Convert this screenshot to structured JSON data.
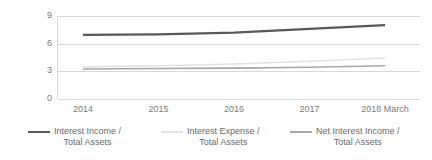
{
  "chart_data": {
    "type": "line",
    "title": "",
    "subtitle": "",
    "xlabel": "",
    "ylabel": "",
    "categories": [
      "2014",
      "2015",
      "2016",
      "2017",
      "2018 March"
    ],
    "ylim": [
      0,
      9
    ],
    "yticks": [
      0,
      3,
      6,
      9
    ],
    "ytick_labels": [
      "0",
      "3",
      "6",
      "9"
    ],
    "grid": "horizontal",
    "legend_position": "bottom",
    "series": [
      {
        "name": "Interest Income /\nTotal Assets",
        "name_line1": "Interest Income /",
        "name_line2": "Total Assets",
        "color": "#595959",
        "width": 2.2,
        "values": [
          6.95,
          7.0,
          7.2,
          7.6,
          8.0
        ]
      },
      {
        "name": "Interest Expense /\nTotal Assets",
        "name_line1": "Interest Expense /",
        "name_line2": "Total Assets",
        "color": "#e2e2e2",
        "width": 1.6,
        "values": [
          3.5,
          3.6,
          3.8,
          4.1,
          4.45
        ]
      },
      {
        "name": "Net Interest Income /\nTotal Assets",
        "name_line1": "Net Interest Income /",
        "name_line2": "Total Assets",
        "color": "#a6a6a6",
        "width": 1.6,
        "values": [
          3.25,
          3.3,
          3.35,
          3.45,
          3.6
        ]
      }
    ]
  },
  "axis": {
    "gridline_color": "#d9d9d9",
    "tick_text_color": "#7a7a7a"
  }
}
